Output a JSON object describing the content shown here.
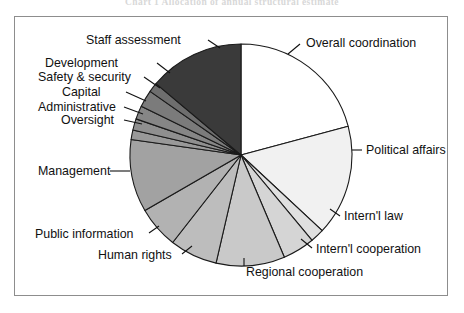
{
  "page": {
    "running_header": "Chart 1  Allocation of annual structural estimate",
    "background_color": "#ffffff",
    "frame_color": "#8d8d8d"
  },
  "chart_data": {
    "type": "pie",
    "title": "",
    "subtitle": "",
    "xlabel": "",
    "ylabel": "",
    "legend_position": "callout-labels",
    "grid": false,
    "start_angle_deg": 0,
    "direction": "clockwise",
    "units": "percent of total",
    "categories": [
      "Overall coordination",
      "Political affairs",
      "Intern'l law",
      "Intern'l cooperation",
      "Regional cooperation",
      "Human rights",
      "Public information",
      "Management",
      "Oversight",
      "Administrative",
      "Capital",
      "Safety & security",
      "Development",
      "Staff assessment"
    ],
    "values": [
      20.8,
      16.1,
      2.0,
      4.7,
      10.0,
      6.9,
      6.1,
      10.6,
      1.4,
      1.7,
      1.9,
      2.5,
      1.4,
      13.9
    ],
    "slices": [
      {
        "label": "Overall coordination",
        "value": 20.8,
        "start_deg": 0.0,
        "end_deg": 75.0,
        "color": "#ffffff",
        "label_side": "right",
        "label_x": 306,
        "label_y": 37,
        "leader": [
          [
            300,
            44
          ],
          [
            288,
            54
          ]
        ]
      },
      {
        "label": "Political affairs",
        "value": 16.1,
        "start_deg": 75.0,
        "end_deg": 133.0,
        "color": "#f1f1f1",
        "label_side": "right",
        "label_x": 366,
        "label_y": 144,
        "leader": [
          [
            362,
            150
          ],
          [
            352,
            150
          ]
        ]
      },
      {
        "label": "Intern'l law",
        "value": 2.0,
        "start_deg": 133.0,
        "end_deg": 140.2,
        "color": "#e0e0e0",
        "label_side": "right",
        "label_x": 344,
        "label_y": 210,
        "leader": [
          [
            340,
            216
          ],
          [
            330,
            209
          ]
        ]
      },
      {
        "label": "Intern'l cooperation",
        "value": 4.7,
        "start_deg": 140.2,
        "end_deg": 157.0,
        "color": "#d5d5d5",
        "label_side": "right",
        "label_x": 316,
        "label_y": 243,
        "leader": [
          [
            312,
            248
          ],
          [
            301,
            239
          ]
        ]
      },
      {
        "label": "Regional cooperation",
        "value": 10.0,
        "start_deg": 157.0,
        "end_deg": 193.0,
        "color": "#c9c9c9",
        "label_side": "right",
        "label_x": 246,
        "label_y": 266,
        "leader": [
          [
            244,
            266
          ],
          [
            244,
            258
          ]
        ]
      },
      {
        "label": "Human rights",
        "value": 6.9,
        "start_deg": 193.0,
        "end_deg": 218.0,
        "color": "#bdbdbd",
        "label_side": "left",
        "label_x": 98,
        "label_y": 249,
        "leader": [
          [
            182,
            254
          ],
          [
            192,
            246
          ]
        ]
      },
      {
        "label": "Public information",
        "value": 6.1,
        "start_deg": 218.0,
        "end_deg": 240.0,
        "color": "#b2b2b2",
        "label_side": "left",
        "label_x": 35,
        "label_y": 228,
        "leader": [
          [
            149,
            233
          ],
          [
            159,
            226
          ]
        ]
      },
      {
        "label": "Management",
        "value": 10.6,
        "start_deg": 240.0,
        "end_deg": 278.0,
        "color": "#a2a2a2",
        "label_side": "left",
        "label_x": 38,
        "label_y": 165,
        "leader": [
          [
            110,
            171
          ],
          [
            130,
            171
          ]
        ]
      },
      {
        "label": "Oversight",
        "value": 1.4,
        "start_deg": 278.0,
        "end_deg": 283.0,
        "color": "#999999",
        "label_side": "left",
        "label_x": 61,
        "label_y": 114,
        "leader": [
          [
            124,
            120
          ],
          [
            142,
            124
          ]
        ]
      },
      {
        "label": "Administrative",
        "value": 1.7,
        "start_deg": 283.0,
        "end_deg": 289.0,
        "color": "#8f8f8f",
        "label_side": "left",
        "label_x": 38,
        "label_y": 101,
        "leader": [
          [
            124,
            107
          ],
          [
            143,
            114
          ]
        ]
      },
      {
        "label": "Capital",
        "value": 1.9,
        "start_deg": 289.0,
        "end_deg": 296.0,
        "color": "#868686",
        "label_side": "left",
        "label_x": 62,
        "label_y": 86,
        "leader": [
          [
            126,
            92
          ],
          [
            146,
            101
          ]
        ]
      },
      {
        "label": "Safety & security",
        "value": 2.5,
        "start_deg": 296.0,
        "end_deg": 305.0,
        "color": "#7b7b7b",
        "label_side": "left",
        "label_x": 38,
        "label_y": 71,
        "leader": [
          [
            144,
            77
          ],
          [
            160,
            88
          ]
        ]
      },
      {
        "label": "Development",
        "value": 1.4,
        "start_deg": 305.0,
        "end_deg": 310.0,
        "color": "#6e6e6e",
        "label_side": "left",
        "label_x": 45,
        "label_y": 57,
        "leader": [
          [
            157,
            63
          ],
          [
            170,
            73
          ]
        ]
      },
      {
        "label": "Staff assessment",
        "value": 13.9,
        "start_deg": 310.0,
        "end_deg": 360.0,
        "color": "#3a3a3a",
        "label_side": "left",
        "label_x": 86,
        "label_y": 34,
        "leader": [
          [
            208,
            40
          ],
          [
            220,
            48
          ]
        ]
      }
    ],
    "geometry": {
      "cx": 241,
      "cy": 155,
      "r": 111
    }
  }
}
